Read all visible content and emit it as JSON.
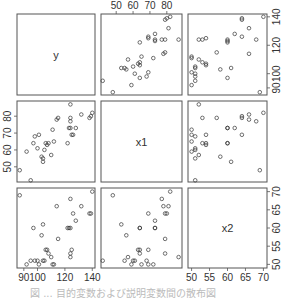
{
  "chart_data": {
    "type": "scatter",
    "title": "",
    "variables": [
      "y",
      "x1",
      "x2"
    ],
    "layout": "scatterplot matrix (pairs), 3x3, variable names on diagonal",
    "axes": {
      "y": {
        "range": [
          85,
          142
        ],
        "ticks": [
          90,
          100,
          120,
          140
        ],
        "tick_labels": [
          "90",
          "100",
          "120",
          "140"
        ]
      },
      "x1": {
        "range": [
          41,
          89
        ],
        "ticks": [
          50,
          60,
          70,
          80
        ],
        "tick_labels": [
          "50",
          "60",
          "70",
          "80"
        ]
      },
      "x2": {
        "range": [
          49,
          71
        ],
        "ticks": [
          50,
          55,
          60,
          65,
          70
        ],
        "tick_labels": [
          "50",
          "55",
          "60",
          "65",
          "70"
        ]
      }
    },
    "tick_positions": {
      "top": [
        "x1"
      ],
      "right": [
        "y",
        "x2"
      ],
      "left": [
        "x1"
      ],
      "bottom": [
        "y",
        "x2"
      ]
    },
    "points": [
      {
        "y": 87,
        "x1": 48,
        "x2": 69
      },
      {
        "y": 92,
        "x1": 59,
        "x2": 50
      },
      {
        "y": 95,
        "x1": 42,
        "x2": 51
      },
      {
        "y": 97,
        "x1": 64,
        "x2": 60
      },
      {
        "y": 98,
        "x1": 68,
        "x2": 51
      },
      {
        "y": 100,
        "x1": 61,
        "x2": 51
      },
      {
        "y": 101,
        "x1": 69,
        "x2": 50
      },
      {
        "y": 103,
        "x1": 56,
        "x2": 58
      },
      {
        "y": 104,
        "x1": 53,
        "x2": 61
      },
      {
        "y": 104,
        "x1": 55,
        "x2": 51
      },
      {
        "y": 105,
        "x1": 60,
        "x2": 51
      },
      {
        "y": 106,
        "x1": 64,
        "x2": 54
      },
      {
        "y": 107,
        "x1": 63,
        "x2": 54
      },
      {
        "y": 108,
        "x1": 64,
        "x2": 53
      },
      {
        "y": 110,
        "x1": 57,
        "x2": 52
      },
      {
        "y": 111,
        "x1": 72,
        "x2": 50
      },
      {
        "y": 112,
        "x1": 65,
        "x2": 50
      },
      {
        "y": 114,
        "x1": 78,
        "x2": 66
      },
      {
        "y": 115,
        "x1": 79,
        "x2": 57
      },
      {
        "y": 122,
        "x1": 64,
        "x2": 60
      },
      {
        "y": 123,
        "x1": 73,
        "x2": 60
      },
      {
        "y": 124,
        "x1": 73,
        "x2": 60
      },
      {
        "y": 124,
        "x1": 77,
        "x2": 68
      },
      {
        "y": 124,
        "x1": 79,
        "x2": 53
      },
      {
        "y": 124,
        "x1": 87,
        "x2": 52
      },
      {
        "y": 125,
        "x1": 69,
        "x2": 54
      },
      {
        "y": 126,
        "x1": 69,
        "x2": 64
      },
      {
        "y": 128,
        "x1": 73,
        "x2": 62
      },
      {
        "y": 132,
        "x1": 81,
        "x2": 66
      },
      {
        "y": 138,
        "x1": 79,
        "x2": 64
      },
      {
        "y": 139,
        "x1": 80,
        "x2": 64
      },
      {
        "y": 140,
        "x1": 82,
        "x2": 70
      }
    ]
  },
  "caption": "図 ... 目的変数および説明変数間の散布図",
  "colors": {
    "frame": "#555555",
    "point": "#333333",
    "text": "#333333",
    "caption": "#bbbbbb"
  }
}
